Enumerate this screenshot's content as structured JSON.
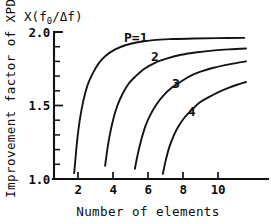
{
  "chart_data": {
    "type": "line",
    "title": "",
    "xlabel": "Number of elements",
    "ylabel": "Improvement factor of XPD",
    "y_unit_label": "X(f₀/Δf)",
    "y_unit_prefix": "X(f",
    "y_unit_sub": "0",
    "y_unit_mid": "/Δf)",
    "xlim": [
      1.0,
      12.0
    ],
    "ylim": [
      1.0,
      2.0
    ],
    "grid": false,
    "legend_position": "inline-curve-labels",
    "xticks": [
      2,
      4,
      6,
      8,
      10
    ],
    "xticklabels": [
      "2",
      "4",
      "6",
      "8",
      "10"
    ],
    "x_minor_ticks": [
      3,
      5,
      7,
      9,
      11
    ],
    "yticks": [
      1.0,
      1.5,
      2.0
    ],
    "yticklabels": [
      "1.0",
      "1.5",
      "2.0"
    ],
    "y_minor_ticks": [
      1.1,
      1.2,
      1.3,
      1.4,
      1.6,
      1.7,
      1.8,
      1.9
    ],
    "series": [
      {
        "name": "P=1",
        "label": "P=1",
        "label_x": 5.3,
        "label_y": 1.93,
        "points": [
          [
            1.78,
            1.04
          ],
          [
            1.85,
            1.13
          ],
          [
            1.95,
            1.26
          ],
          [
            2.1,
            1.4
          ],
          [
            2.3,
            1.53
          ],
          [
            2.55,
            1.64
          ],
          [
            2.85,
            1.72
          ],
          [
            3.2,
            1.79
          ],
          [
            3.6,
            1.84
          ],
          [
            4.1,
            1.88
          ],
          [
            4.7,
            1.91
          ],
          [
            5.4,
            1.93
          ],
          [
            6.3,
            1.945
          ],
          [
            7.4,
            1.952
          ],
          [
            8.6,
            1.956
          ],
          [
            10.0,
            1.958
          ],
          [
            11.5,
            1.96
          ]
        ]
      },
      {
        "name": "2",
        "label": "2",
        "label_x": 6.4,
        "label_y": 1.8,
        "points": [
          [
            3.55,
            1.09
          ],
          [
            3.65,
            1.18
          ],
          [
            3.8,
            1.29
          ],
          [
            4.0,
            1.4
          ],
          [
            4.25,
            1.5
          ],
          [
            4.55,
            1.58
          ],
          [
            4.9,
            1.65
          ],
          [
            5.3,
            1.7
          ],
          [
            5.8,
            1.75
          ],
          [
            6.4,
            1.79
          ],
          [
            7.1,
            1.82
          ],
          [
            7.9,
            1.845
          ],
          [
            8.8,
            1.862
          ],
          [
            9.8,
            1.875
          ],
          [
            10.8,
            1.883
          ],
          [
            11.6,
            1.888
          ]
        ]
      },
      {
        "name": "3",
        "label": "3",
        "label_x": 7.6,
        "label_y": 1.62,
        "points": [
          [
            5.25,
            1.07
          ],
          [
            5.4,
            1.16
          ],
          [
            5.6,
            1.26
          ],
          [
            5.85,
            1.36
          ],
          [
            6.15,
            1.44
          ],
          [
            6.5,
            1.51
          ],
          [
            6.9,
            1.57
          ],
          [
            7.35,
            1.62
          ],
          [
            7.85,
            1.66
          ],
          [
            8.4,
            1.7
          ],
          [
            9.0,
            1.73
          ],
          [
            9.7,
            1.755
          ],
          [
            10.4,
            1.775
          ],
          [
            11.1,
            1.79
          ],
          [
            11.6,
            1.8
          ]
        ]
      },
      {
        "name": "4",
        "label": "4",
        "label_x": 8.5,
        "label_y": 1.43,
        "points": [
          [
            6.85,
            1.035
          ],
          [
            7.0,
            1.12
          ],
          [
            7.2,
            1.21
          ],
          [
            7.45,
            1.29
          ],
          [
            7.75,
            1.36
          ],
          [
            8.1,
            1.42
          ],
          [
            8.5,
            1.47
          ],
          [
            8.95,
            1.52
          ],
          [
            9.45,
            1.555
          ],
          [
            10.0,
            1.59
          ],
          [
            10.6,
            1.62
          ],
          [
            11.2,
            1.645
          ],
          [
            11.6,
            1.66
          ]
        ]
      }
    ]
  }
}
